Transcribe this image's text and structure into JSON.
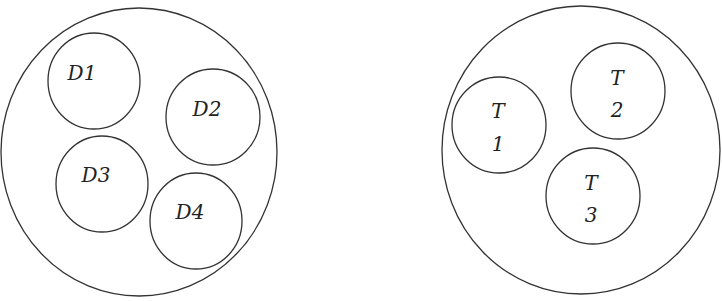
{
  "diagram": {
    "groups": [
      {
        "name": "D-set",
        "outer": {
          "cx": 139,
          "cy": 152,
          "rx": 138,
          "ry": 144
        },
        "members": [
          {
            "id": "D1",
            "lines": [
              "D1"
            ],
            "cx": 94,
            "cy": 81,
            "r": 46
          },
          {
            "id": "D2",
            "lines": [
              "D2"
            ],
            "cx": 213,
            "cy": 117,
            "r": 47
          },
          {
            "id": "D3",
            "lines": [
              "D3"
            ],
            "cx": 102,
            "cy": 184,
            "r": 46
          },
          {
            "id": "D4",
            "lines": [
              "D4"
            ],
            "cx": 196,
            "cy": 221,
            "r": 46
          }
        ]
      },
      {
        "name": "T-set",
        "outer": {
          "cx": 581,
          "cy": 150,
          "rx": 139,
          "ry": 144
        },
        "members": [
          {
            "id": "T1",
            "lines": [
              "T",
              "1"
            ],
            "cx": 499,
            "cy": 125,
            "r": 47
          },
          {
            "id": "T2",
            "lines": [
              "T",
              "2"
            ],
            "cx": 618,
            "cy": 91,
            "r": 47
          },
          {
            "id": "T3",
            "lines": [
              "T",
              "3"
            ],
            "cx": 593,
            "cy": 196,
            "r": 47
          }
        ]
      }
    ],
    "stroke_color": "#333333"
  }
}
